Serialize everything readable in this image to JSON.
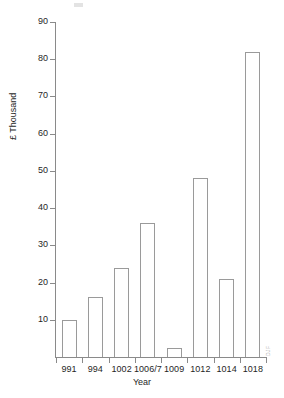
{
  "chart_data": {
    "type": "bar",
    "title": "",
    "subtitle": "",
    "xlabel": "Year",
    "ylabel": "£ Thousand",
    "categories": [
      "991",
      "994",
      "1002",
      "1006/7",
      "1009",
      "1012",
      "1014",
      "1018"
    ],
    "values": [
      10,
      16,
      24,
      36,
      2.5,
      48,
      21,
      82
    ],
    "series": [
      {
        "name": "£ Thousand",
        "values": [
          10,
          16,
          24,
          36,
          2.5,
          48,
          21,
          82
        ]
      }
    ],
    "ylim": [
      0,
      90
    ],
    "yticks": [
      10,
      20,
      30,
      40,
      50,
      60,
      70,
      80,
      90
    ],
    "ytick_labels": [
      "10",
      "20",
      "30",
      "40",
      "50",
      "60",
      "70",
      "80",
      "90"
    ],
    "grid": false,
    "legend": false,
    "legend_position": "none",
    "bar_fill_color": "#ffffff",
    "bar_edge_color": "#9a9a9a",
    "axis_color": "#8a8a8a",
    "background_color": "#ffffff",
    "text_color": "#1f1f1f",
    "annotations": []
  },
  "artifacts": {
    "watermark_text": "DJF"
  }
}
